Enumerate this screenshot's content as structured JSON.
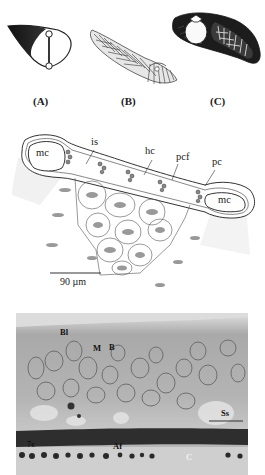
{
  "figure": {
    "top_row": {
      "panels": [
        {
          "id": "A",
          "label": "(A)",
          "description": "cross-section of wing-shaped gill filament with dark leading edge and supporting rod between two circular cartilages"
        },
        {
          "id": "B",
          "label": "(B)",
          "description": "feather-like plumose structure with radiating filaments"
        },
        {
          "id": "C",
          "label": "(C)",
          "description": "elongated lobe with striated dark tissue around an oval cavity"
        }
      ]
    },
    "diagram": {
      "labels": {
        "mc_left": "mc",
        "mc_right": "mc",
        "is": "is",
        "hc": "hc",
        "pcf": "pcf",
        "pc": "pc"
      },
      "scale_bar": "90 µm"
    },
    "micrograph": {
      "labels": {
        "bl": "Bl",
        "m": "M",
        "b": "B",
        "ss": "Ss",
        "seven_c": "7c",
        "af": "Af",
        "c": "C"
      }
    }
  }
}
